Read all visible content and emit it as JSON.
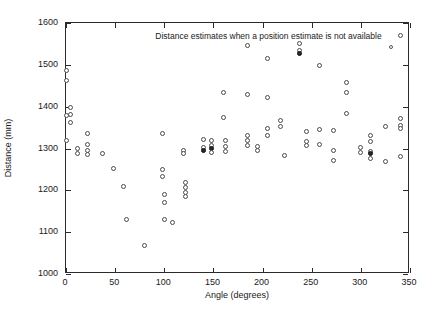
{
  "chart_data": {
    "type": "scatter",
    "title": "",
    "xlabel": "Angle (degrees)",
    "ylabel": "Distance (mm)",
    "xlim": [
      0,
      350
    ],
    "ylim": [
      1000,
      1600
    ],
    "xticks": [
      0,
      50,
      100,
      150,
      200,
      250,
      300,
      350
    ],
    "yticks": [
      1000,
      1100,
      1200,
      1300,
      1400,
      1500,
      1600
    ],
    "grid": false,
    "legend_position": "top-right-inside",
    "legend": [
      {
        "label": "Distance estimates when a position estimate is not available",
        "marker": "open-circle",
        "color": "#4a4a4a"
      }
    ],
    "marker_style": "open-circle",
    "marker_color": "#4a4a4a",
    "series": [
      {
        "name": "Distance estimates when a position estimate is not available",
        "points": [
          [
            0,
            1487
          ],
          [
            0,
            1462
          ],
          [
            0,
            1378
          ],
          [
            0,
            1318
          ],
          [
            5,
            1397
          ],
          [
            5,
            1381
          ],
          [
            5,
            1363
          ],
          [
            12,
            1300
          ],
          [
            12,
            1288
          ],
          [
            22,
            1337
          ],
          [
            22,
            1310
          ],
          [
            22,
            1296
          ],
          [
            22,
            1286
          ],
          [
            37,
            1287
          ],
          [
            48,
            1253
          ],
          [
            58,
            1208
          ],
          [
            62,
            1130
          ],
          [
            80,
            1068
          ],
          [
            98,
            1336
          ],
          [
            98,
            1250
          ],
          [
            98,
            1232
          ],
          [
            100,
            1189
          ],
          [
            100,
            1172
          ],
          [
            100,
            1130
          ],
          [
            108,
            1124
          ],
          [
            120,
            1296
          ],
          [
            120,
            1288
          ],
          [
            122,
            1218
          ],
          [
            122,
            1206
          ],
          [
            122,
            1196
          ],
          [
            122,
            1185
          ],
          [
            140,
            1322
          ],
          [
            140,
            1302
          ],
          [
            140,
            1296
          ],
          [
            148,
            1318
          ],
          [
            148,
            1306
          ],
          [
            148,
            1300
          ],
          [
            148,
            1290
          ],
          [
            160,
            1434
          ],
          [
            160,
            1373
          ],
          [
            162,
            1318
          ],
          [
            162,
            1304
          ],
          [
            162,
            1294
          ],
          [
            185,
            1546
          ],
          [
            185,
            1428
          ],
          [
            185,
            1330
          ],
          [
            185,
            1318
          ],
          [
            185,
            1307
          ],
          [
            195,
            1304
          ],
          [
            195,
            1296
          ],
          [
            205,
            1516
          ],
          [
            205,
            1423
          ],
          [
            205,
            1348
          ],
          [
            205,
            1330
          ],
          [
            218,
            1368
          ],
          [
            218,
            1352
          ],
          [
            222,
            1283
          ],
          [
            238,
            1552
          ],
          [
            238,
            1534
          ],
          [
            238,
            1528
          ],
          [
            245,
            1340
          ],
          [
            245,
            1316
          ],
          [
            245,
            1306
          ],
          [
            258,
            1498
          ],
          [
            258,
            1346
          ],
          [
            258,
            1310
          ],
          [
            272,
            1342
          ],
          [
            272,
            1296
          ],
          [
            272,
            1272
          ],
          [
            285,
            1458
          ],
          [
            285,
            1435
          ],
          [
            285,
            1383
          ],
          [
            300,
            1303
          ],
          [
            300,
            1290
          ],
          [
            310,
            1330
          ],
          [
            310,
            1316
          ],
          [
            310,
            1293
          ],
          [
            310,
            1287
          ],
          [
            310,
            1276
          ],
          [
            325,
            1352
          ],
          [
            325,
            1268
          ],
          [
            340,
            1570
          ],
          [
            340,
            1372
          ],
          [
            340,
            1356
          ],
          [
            340,
            1348
          ],
          [
            340,
            1282
          ]
        ]
      }
    ]
  }
}
